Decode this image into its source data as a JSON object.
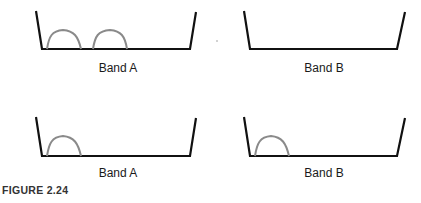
{
  "figure": {
    "caption": "FIGURE 2.24",
    "colors": {
      "band_outline": "#111111",
      "peak": "#8a8a8a",
      "background": "#ffffff"
    },
    "panels": [
      {
        "id": "top-left",
        "label": "Band A",
        "peaks": 2
      },
      {
        "id": "top-right",
        "label": "Band B",
        "peaks": 0
      },
      {
        "id": "bottom-left",
        "label": "Band A",
        "peaks": 1
      },
      {
        "id": "bottom-right",
        "label": "Band B",
        "peaks": 1
      }
    ]
  }
}
